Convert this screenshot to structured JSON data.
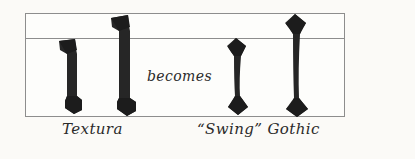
{
  "figure": {
    "kind": "calligraphy-comparison-diagram",
    "background_color": "#fbfaf7",
    "ink_color": "#2b2b2b",
    "rule_color": "#8d8d8d"
  },
  "frame": {
    "label": "writing-guideline-box",
    "baseline_label": "baseline",
    "xheight_label": "x-height-line"
  },
  "strokes": [
    {
      "id": "textura-short",
      "style": "Textura",
      "height_class": "x-height",
      "serif_top": "slab-wedge",
      "serif_bottom": "slab-wedge",
      "stem": "straight"
    },
    {
      "id": "textura-tall",
      "style": "Textura",
      "height_class": "ascender",
      "serif_top": "slab-wedge",
      "serif_bottom": "slab-wedge",
      "stem": "straight"
    },
    {
      "id": "swing-short",
      "style": "Swing Gothic",
      "height_class": "x-height",
      "serif_top": "diamond",
      "serif_bottom": "diamond",
      "stem": "swung"
    },
    {
      "id": "swing-tall",
      "style": "Swing Gothic",
      "height_class": "ascender",
      "serif_top": "diamond",
      "serif_bottom": "diamond",
      "stem": "swung"
    }
  ],
  "annotations": {
    "becomes": "becomes",
    "left_caption": "Textura",
    "right_caption": "“Swing” Gothic"
  }
}
